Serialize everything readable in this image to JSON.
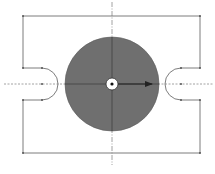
{
  "diagram": {
    "type": "mechanical-sketch",
    "colors": {
      "background": "#ffffff",
      "frame_line": "#6e6e6e",
      "centerline": "#8a8a8a",
      "disc_fill": "#6f6f6f",
      "hole_fill": "#ffffff",
      "hole_dot": "#111111",
      "arrow": "#222222"
    },
    "frame": {
      "left": 23,
      "right": 200,
      "top": 16,
      "bottom": 153
    },
    "center": {
      "x": 112,
      "y": 84
    },
    "disc": {
      "radius": 47
    },
    "hole": {
      "radius": 6,
      "inner_radius": 1.6
    },
    "notches": [
      {
        "side": "left",
        "top_y": 68,
        "bottom_y": 100,
        "start_x": 42,
        "radius": 16
      },
      {
        "side": "right",
        "top_y": 68,
        "bottom_y": 100,
        "start_x": 181,
        "radius": 16
      }
    ],
    "centerlines": {
      "horizontal": {
        "y": 84,
        "x1": 4,
        "x2": 213
      },
      "vertical": {
        "x": 112,
        "y1": 2,
        "y2": 165
      }
    },
    "direction_arrow": {
      "from_x": 118,
      "to_x": 153,
      "y": 84
    }
  }
}
